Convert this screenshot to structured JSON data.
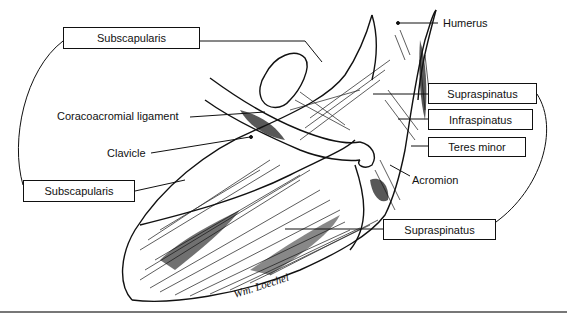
{
  "figure": {
    "labels": {
      "subscapularis_top": "Subscapularis",
      "subscapularis_bottom": "Subscapularis",
      "coracoacromial_ligament": "Coracoacromial ligament",
      "clavicle": "Clavicle",
      "humerus": "Humerus",
      "supraspinatus_top": "Supraspinatus",
      "infraspinatus": "Infraspinatus",
      "teres_minor": "Teres minor",
      "acromion": "Acromion",
      "supraspinatus_bottom": "Supraspinatus"
    },
    "signature": "Wm. Loechel",
    "colors": {
      "ink": "#111111",
      "paper": "#ffffff",
      "rule": "#777777"
    }
  }
}
